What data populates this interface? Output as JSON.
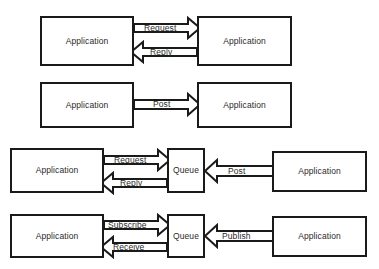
{
  "diagram": {
    "background_color": "#ffffff",
    "stroke_color": "#1a1a1a",
    "text_color": "#2b2b2b",
    "rows": [
      {
        "id": "row-request-reply",
        "nodes": [
          {
            "id": "r1-app-left",
            "label": "Application",
            "x": 40,
            "y": 16,
            "w": 94,
            "h": 50
          },
          {
            "id": "r1-app-right",
            "label": "Application",
            "x": 197,
            "y": 16,
            "w": 95,
            "h": 50
          }
        ],
        "arrows": [
          {
            "id": "r1-request",
            "label": "Request",
            "direction": "right",
            "x": 134,
            "y": 18,
            "w": 66,
            "h": 20,
            "label_x": 144,
            "label_y": 24
          },
          {
            "id": "r1-reply",
            "label": "Reply",
            "direction": "left",
            "x": 131,
            "y": 42,
            "w": 66,
            "h": 20,
            "label_x": 150,
            "label_y": 48
          }
        ]
      },
      {
        "id": "row-post",
        "nodes": [
          {
            "id": "r2-app-left",
            "label": "Application",
            "x": 40,
            "y": 82,
            "w": 94,
            "h": 46
          },
          {
            "id": "r2-app-right",
            "label": "Application",
            "x": 197,
            "y": 82,
            "w": 95,
            "h": 46
          }
        ],
        "arrows": [
          {
            "id": "r2-post",
            "label": "Post",
            "direction": "right",
            "x": 134,
            "y": 94,
            "w": 66,
            "h": 21,
            "label_x": 153,
            "label_y": 100
          }
        ]
      },
      {
        "id": "row-queue-request-reply",
        "nodes": [
          {
            "id": "r3-app-left",
            "label": "Application",
            "x": 10,
            "y": 148,
            "w": 94,
            "h": 45
          },
          {
            "id": "r3-queue",
            "label": "Queue",
            "x": 167,
            "y": 148,
            "w": 38,
            "h": 45
          },
          {
            "id": "r3-app-right",
            "label": "Application",
            "x": 272,
            "y": 151,
            "w": 95,
            "h": 41
          }
        ],
        "arrows": [
          {
            "id": "r3-request",
            "label": "Request",
            "direction": "right",
            "x": 104,
            "y": 150,
            "w": 66,
            "h": 20,
            "label_x": 114,
            "label_y": 156
          },
          {
            "id": "r3-reply",
            "label": "Reply",
            "direction": "left",
            "x": 101,
            "y": 173,
            "w": 66,
            "h": 20,
            "label_x": 120,
            "label_y": 179
          },
          {
            "id": "r3-post",
            "label": "Post",
            "direction": "left",
            "x": 205,
            "y": 160,
            "w": 68,
            "h": 22,
            "label_x": 228,
            "label_y": 167
          }
        ]
      },
      {
        "id": "row-publish-subscribe",
        "nodes": [
          {
            "id": "r4-app-left",
            "label": "Application",
            "x": 10,
            "y": 214,
            "w": 94,
            "h": 44
          },
          {
            "id": "r4-queue",
            "label": "Queue",
            "x": 167,
            "y": 214,
            "w": 38,
            "h": 44
          },
          {
            "id": "r4-app-right",
            "label": "Application",
            "x": 272,
            "y": 216,
            "w": 95,
            "h": 41
          }
        ],
        "arrows": [
          {
            "id": "r4-subscribe",
            "label": "Subscribe",
            "direction": "right",
            "x": 104,
            "y": 215,
            "w": 66,
            "h": 20,
            "label_x": 108,
            "label_y": 221
          },
          {
            "id": "r4-receive",
            "label": "Receive",
            "direction": "left",
            "x": 101,
            "y": 237,
            "w": 66,
            "h": 20,
            "label_x": 113,
            "label_y": 243
          },
          {
            "id": "r4-publish",
            "label": "Publish",
            "direction": "left",
            "x": 205,
            "y": 225,
            "w": 68,
            "h": 22,
            "label_x": 222,
            "label_y": 232
          }
        ]
      }
    ]
  }
}
